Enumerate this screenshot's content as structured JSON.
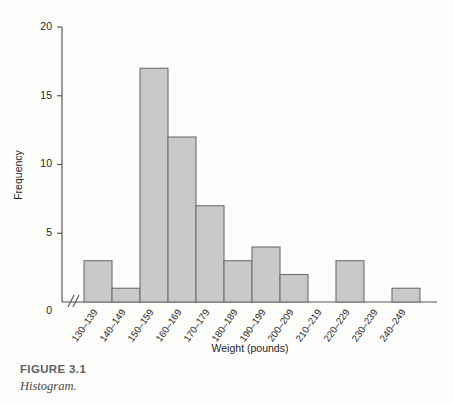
{
  "figure": {
    "caption_title": "FIGURE 3.1",
    "caption_subtitle": "Histogram."
  },
  "colors": {
    "bar_fill": "#c9c9c9",
    "bar_stroke": "#6e6e6e",
    "axis": "#555555",
    "text": "#1d1d1d",
    "caption": "#5f5f5f",
    "background": "#fdfdfb"
  },
  "chart_data": {
    "type": "bar",
    "title": "",
    "subtitle": "",
    "xlabel": "Weight (pounds)",
    "ylabel": "Frequency",
    "categories": [
      "130–139",
      "140–149",
      "150–159",
      "160–169",
      "170–179",
      "180–189",
      "190–199",
      "200–209",
      "210–219",
      "220–229",
      "230–239",
      "240–249"
    ],
    "values": [
      3,
      1,
      17,
      12,
      7,
      3,
      4,
      2,
      0,
      3,
      0,
      1
    ],
    "ylim": [
      0,
      20
    ],
    "yticks": [
      0,
      5,
      10,
      15,
      20
    ],
    "ytick_labels": [
      "0",
      "5",
      "10",
      "15",
      "20"
    ],
    "grid": false,
    "legend": false,
    "legend_position": "none",
    "axis_break": "//",
    "xtick_rotation_deg": 55
  }
}
